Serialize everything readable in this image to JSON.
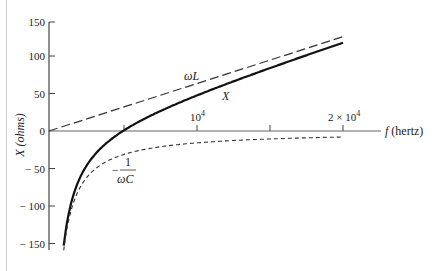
{
  "chart_data": {
    "type": "line",
    "title": "",
    "xlabel": "f (hertz)",
    "ylabel": "X (ohms)",
    "xlim": [
      0,
      20000
    ],
    "ylim": [
      -160,
      150
    ],
    "grid": false,
    "legend": "none (inline annotations)",
    "x_ticks": [
      {
        "value": 0,
        "label": ""
      },
      {
        "value": 5000,
        "label": ""
      },
      {
        "value": 10000,
        "label": "10^4"
      },
      {
        "value": 15000,
        "label": ""
      },
      {
        "value": 20000,
        "label": "2 × 10^4"
      }
    ],
    "y_ticks": [
      {
        "value": 150,
        "label": "150"
      },
      {
        "value": 100,
        "label": "100"
      },
      {
        "value": 50,
        "label": "50"
      },
      {
        "value": 0,
        "label": "0"
      },
      {
        "value": -50,
        "label": "−50"
      },
      {
        "value": -100,
        "label": "−100"
      },
      {
        "value": -150,
        "label": "−150"
      }
    ],
    "x": [
      1000,
      1500,
      2000,
      3000,
      4000,
      5000,
      6000,
      8000,
      10000,
      12000,
      14000,
      16000,
      18000,
      20000
    ],
    "series": [
      {
        "name": "ωL",
        "style": "long-dash",
        "x": [
          0,
          20000
        ],
        "values": [
          0,
          125.7
        ]
      },
      {
        "name": "X",
        "style": "solid-bold",
        "values": [
          -152.9,
          -96.7,
          -67.0,
          -34.2,
          -14.7,
          -0.4,
          11.2,
          30.4,
          46.9,
          62.1,
          76.6,
          90.6,
          104.3,
          117.7
        ]
      },
      {
        "name": "−1/ωC",
        "style": "short-dash",
        "values": [
          -159.2,
          -106.1,
          -79.6,
          -53.1,
          -39.8,
          -31.8,
          -26.5,
          -19.9,
          -15.9,
          -13.3,
          -11.4,
          -9.9,
          -8.8,
          -8.0
        ]
      }
    ],
    "annotations": [
      {
        "text": "ωL",
        "near": "dashed line, f≈8000"
      },
      {
        "text": "X",
        "near": "solid curve, f≈11500"
      },
      {
        "text": "−1/ωC",
        "near": "dotted curve, f≈5000, X≈−60"
      }
    ],
    "resonance_frequency_hz": 5000
  },
  "labels": {
    "ylabel": "X (ohms)",
    "xlabel": "f (hertz)",
    "omegaL": "ωL",
    "X": "X",
    "minus": "−",
    "one": "1",
    "omegaC": "ωC",
    "xtick_10_4_base": "10",
    "xtick_10_4_exp": "4",
    "xtick_2x_base": "2 × 10",
    "xtick_2x_exp": "4",
    "y150": "150",
    "y100": "100",
    "y50": "50",
    "y0": "0",
    "ym50": "− 50",
    "ym100": "− 100",
    "ym150": "− 150"
  }
}
